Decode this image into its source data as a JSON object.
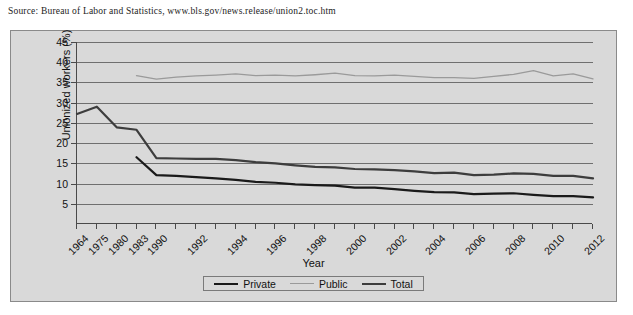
{
  "source_note": "Source: Bureau of Labor and Statistics, www.bls.gov/news.release/union2.toc.htm",
  "legend": {
    "items": [
      {
        "label": "Private",
        "color": "#1a1a1a",
        "name": "legend-private"
      },
      {
        "label": "Public",
        "color": "#9a9a9a",
        "name": "legend-public"
      },
      {
        "label": "Total",
        "color": "#3d3d3d",
        "name": "legend-total"
      }
    ]
  },
  "chart_data": {
    "type": "line",
    "title": "",
    "xlabel": "Year",
    "ylabel": "Unionized workers (%)",
    "ylim": [
      0,
      45
    ],
    "yticks": [
      5,
      10,
      15,
      20,
      25,
      30,
      35,
      40,
      45
    ],
    "grid": true,
    "legend_position": "bottom",
    "x": [
      1964,
      1975,
      1980,
      1983,
      1990,
      1991,
      1992,
      1993,
      1994,
      1995,
      1996,
      1997,
      1998,
      1999,
      2000,
      2001,
      2002,
      2003,
      2004,
      2005,
      2006,
      2007,
      2008,
      2009,
      2010,
      2011,
      2012
    ],
    "xtick_labels": [
      "1964",
      "1975",
      "1980",
      "1983",
      "1990",
      "",
      "1992",
      "",
      "1994",
      "",
      "1996",
      "",
      "1998",
      "",
      "2000",
      "",
      "2002",
      "",
      "2004",
      "",
      "2006",
      "",
      "2008",
      "",
      "2010",
      "",
      "2012"
    ],
    "series": [
      {
        "name": "Total",
        "color": "#3d3d3d",
        "width": 2.2,
        "x": [
          1964,
          1975,
          1980,
          1983,
          1990,
          1991,
          1992,
          1993,
          1994,
          1995,
          1996,
          1997,
          1998,
          1999,
          2000,
          2001,
          2002,
          2003,
          2004,
          2005,
          2006,
          2007,
          2008,
          2009,
          2010,
          2011,
          2012
        ],
        "values": [
          27.2,
          29.0,
          23.9,
          23.3,
          16.3,
          16.2,
          16.1,
          16.1,
          15.8,
          15.3,
          15.0,
          14.5,
          14.1,
          14.0,
          13.6,
          13.5,
          13.3,
          13.0,
          12.6,
          12.7,
          12.1,
          12.2,
          12.5,
          12.4,
          11.9,
          11.9,
          11.3
        ]
      },
      {
        "name": "Private",
        "color": "#1a1a1a",
        "width": 2.2,
        "x": [
          1983,
          1990,
          1991,
          1992,
          1993,
          1994,
          1995,
          1996,
          1997,
          1998,
          1999,
          2000,
          2001,
          2002,
          2003,
          2004,
          2005,
          2006,
          2007,
          2008,
          2009,
          2010,
          2011,
          2012
        ],
        "values": [
          16.5,
          12.1,
          11.9,
          11.6,
          11.3,
          10.9,
          10.4,
          10.2,
          9.8,
          9.6,
          9.5,
          9.0,
          9.0,
          8.6,
          8.2,
          7.9,
          7.8,
          7.4,
          7.5,
          7.6,
          7.2,
          6.9,
          6.9,
          6.6
        ]
      },
      {
        "name": "Public",
        "color": "#9a9a9a",
        "width": 1.3,
        "x": [
          1983,
          1990,
          1991,
          1992,
          1993,
          1994,
          1995,
          1996,
          1997,
          1998,
          1999,
          2000,
          2001,
          2002,
          2003,
          2004,
          2005,
          2006,
          2007,
          2008,
          2009,
          2010,
          2011,
          2012
        ],
        "values": [
          36.7,
          35.8,
          36.3,
          36.6,
          36.8,
          37.1,
          36.7,
          36.8,
          36.6,
          36.9,
          37.3,
          36.7,
          36.6,
          36.8,
          36.5,
          36.2,
          36.2,
          36.0,
          36.5,
          37.0,
          37.9,
          36.6,
          37.1,
          35.9
        ]
      }
    ]
  }
}
